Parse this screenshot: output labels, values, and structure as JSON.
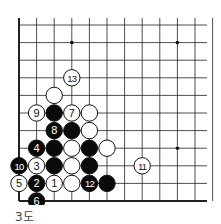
{
  "diagram": {
    "caption": "3도",
    "board": {
      "columns": 12,
      "rows": 11,
      "edges": [
        "left",
        "bottom"
      ],
      "star_points": [
        [
          3,
          1
        ],
        [
          9,
          1
        ],
        [
          9,
          7
        ]
      ],
      "stones": [
        {
          "col": 3,
          "row": 3,
          "color": "white",
          "label": "13"
        },
        {
          "col": 2,
          "row": 4,
          "color": "white",
          "label": ""
        },
        {
          "col": 1,
          "row": 5,
          "color": "white",
          "label": "9"
        },
        {
          "col": 2,
          "row": 5,
          "color": "black",
          "label": ""
        },
        {
          "col": 3,
          "row": 5,
          "color": "white",
          "label": "7"
        },
        {
          "col": 4,
          "row": 5,
          "color": "white",
          "label": ""
        },
        {
          "col": 2,
          "row": 6,
          "color": "black",
          "label": "8"
        },
        {
          "col": 3,
          "row": 6,
          "color": "black",
          "label": ""
        },
        {
          "col": 4,
          "row": 6,
          "color": "white",
          "label": ""
        },
        {
          "col": 1,
          "row": 7,
          "color": "black",
          "label": "4"
        },
        {
          "col": 2,
          "row": 7,
          "color": "black",
          "label": ""
        },
        {
          "col": 3,
          "row": 7,
          "color": "white",
          "label": ""
        },
        {
          "col": 4,
          "row": 7,
          "color": "black",
          "label": ""
        },
        {
          "col": 5,
          "row": 7,
          "color": "white",
          "label": ""
        },
        {
          "col": 0,
          "row": 8,
          "color": "black",
          "label": "10"
        },
        {
          "col": 1,
          "row": 8,
          "color": "white",
          "label": "3"
        },
        {
          "col": 2,
          "row": 8,
          "color": "black",
          "label": ""
        },
        {
          "col": 3,
          "row": 8,
          "color": "white",
          "label": ""
        },
        {
          "col": 4,
          "row": 8,
          "color": "black",
          "label": ""
        },
        {
          "col": 7,
          "row": 8,
          "color": "white",
          "label": "11"
        },
        {
          "col": 0,
          "row": 9,
          "color": "white",
          "label": "5"
        },
        {
          "col": 1,
          "row": 9,
          "color": "black",
          "label": "2"
        },
        {
          "col": 2,
          "row": 9,
          "color": "white",
          "label": "1"
        },
        {
          "col": 3,
          "row": 9,
          "color": "white",
          "label": ""
        },
        {
          "col": 4,
          "row": 9,
          "color": "black",
          "label": "12"
        },
        {
          "col": 5,
          "row": 9,
          "color": "black",
          "label": ""
        },
        {
          "col": 1,
          "row": 10,
          "color": "black",
          "label": "6"
        }
      ]
    }
  }
}
